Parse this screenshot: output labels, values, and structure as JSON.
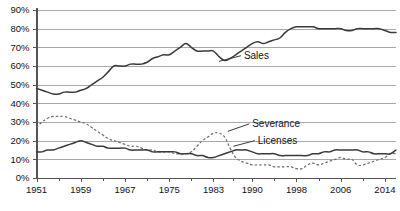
{
  "chart_data": {
    "type": "line",
    "title": "",
    "xlabel": "",
    "ylabel": "",
    "ylim": [
      0,
      90
    ],
    "xlim": [
      1951,
      2016
    ],
    "grid": true,
    "legend_position": "inline-labels",
    "ytick_labels": [
      "0%",
      "10%",
      "20%",
      "30%",
      "40%",
      "50%",
      "60%",
      "70%",
      "80%",
      "90%"
    ],
    "ytick_values": [
      0,
      10,
      20,
      30,
      40,
      50,
      60,
      70,
      80,
      90
    ],
    "xtick_labels": [
      "1951",
      "1959",
      "1967",
      "1975",
      "1983",
      "1990",
      "1998",
      "2006",
      "2014"
    ],
    "xtick_values": [
      1951,
      1959,
      1967,
      1975,
      1983,
      1990,
      1998,
      2006,
      2014
    ],
    "x": [
      1951,
      1952,
      1953,
      1954,
      1955,
      1956,
      1957,
      1958,
      1959,
      1960,
      1961,
      1962,
      1963,
      1964,
      1965,
      1966,
      1967,
      1968,
      1969,
      1970,
      1971,
      1972,
      1973,
      1974,
      1975,
      1976,
      1977,
      1978,
      1979,
      1980,
      1981,
      1982,
      1983,
      1984,
      1985,
      1986,
      1987,
      1988,
      1989,
      1990,
      1991,
      1992,
      1993,
      1994,
      1995,
      1996,
      1997,
      1998,
      1999,
      2000,
      2001,
      2002,
      2003,
      2004,
      2005,
      2006,
      2007,
      2008,
      2009,
      2010,
      2011,
      2012,
      2013,
      2014,
      2015,
      2016
    ],
    "series": [
      {
        "name": "Sales",
        "style": "solid",
        "color": "#3a3a3a",
        "label_x": 1991,
        "label_y": 67,
        "values": [
          48,
          47,
          46,
          45,
          45,
          46,
          46,
          46,
          47,
          48,
          50,
          52,
          54,
          57,
          60,
          60,
          60,
          61,
          61,
          61,
          62,
          64,
          65,
          66,
          66,
          68,
          70,
          72,
          70,
          68,
          68,
          68,
          68,
          65,
          63,
          64,
          66,
          68,
          70,
          72,
          73,
          72,
          73,
          74,
          75,
          78,
          80,
          81,
          81,
          81,
          81,
          80,
          80,
          80,
          80,
          80,
          79,
          79,
          80,
          80,
          80,
          80,
          80,
          79,
          78,
          78
        ]
      },
      {
        "name": "Severance",
        "style": "dashed",
        "color": "#6e6e6e",
        "label_x": 1993,
        "label_y": 30,
        "values": [
          27,
          30,
          32,
          33,
          33,
          33,
          32,
          31,
          30,
          29,
          27,
          25,
          23,
          21,
          20,
          19,
          18,
          17,
          17,
          16,
          15,
          15,
          14,
          14,
          14,
          13,
          13,
          13,
          14,
          17,
          20,
          22,
          24,
          24,
          22,
          16,
          11,
          9,
          8,
          7,
          7,
          7,
          7,
          6,
          6,
          6,
          6,
          5,
          5,
          7,
          8,
          7,
          8,
          9,
          10,
          11,
          10,
          10,
          7,
          7,
          8,
          9,
          10,
          11,
          13,
          13
        ]
      },
      {
        "name": "Licenses",
        "style": "solid",
        "color": "#3a3a3a",
        "label_x": 1993,
        "label_y": 21,
        "values": [
          14,
          14,
          15,
          15,
          16,
          17,
          18,
          19,
          20,
          19,
          18,
          17,
          17,
          16,
          16,
          16,
          16,
          15,
          15,
          15,
          15,
          14,
          14,
          14,
          14,
          14,
          13,
          13,
          13,
          12,
          12,
          11,
          11,
          12,
          13,
          14,
          15,
          15,
          15,
          14,
          13,
          13,
          13,
          13,
          12,
          12,
          12,
          12,
          12,
          12,
          13,
          13,
          14,
          14,
          15,
          15,
          15,
          15,
          15,
          14,
          14,
          13,
          13,
          13,
          13,
          15
        ]
      }
    ]
  }
}
